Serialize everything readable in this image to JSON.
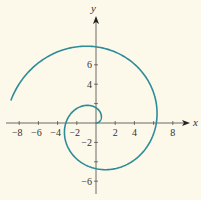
{
  "chart_data": {
    "type": "line",
    "title": "",
    "xlabel": "x",
    "ylabel": "y",
    "xlim": [
      -9.3,
      10
    ],
    "ylim": [
      -7.2,
      10
    ],
    "x_ticks": [
      -8,
      -6,
      -4,
      -2,
      2,
      4,
      8
    ],
    "x_tick_labels": [
      "−8",
      "−6",
      "−4",
      "−2",
      "2",
      "4",
      "8"
    ],
    "x_minor_ticks": [
      6
    ],
    "y_ticks": [
      6,
      4,
      -2,
      -6
    ],
    "y_tick_labels": [
      "6",
      "4",
      "−2",
      "−6"
    ],
    "y_minor_ticks": [
      2,
      -4
    ],
    "grid": false,
    "legend": null,
    "series": [
      {
        "name": "spiral",
        "equation": "r = theta",
        "theta_range": [
          0,
          9.17
        ],
        "color": "#2e8c98",
        "key_points": [
          {
            "x": 0,
            "y": 0
          },
          {
            "x": 0,
            "y": 1.57
          },
          {
            "x": -3.14,
            "y": 0
          },
          {
            "x": 0,
            "y": -4.71
          },
          {
            "x": 6.28,
            "y": 0
          },
          {
            "x": 0,
            "y": 7.85
          },
          {
            "x": -8.9,
            "y": 2.2
          }
        ]
      }
    ]
  },
  "style": {
    "background": "#fcf8ea",
    "axis_color": "#444444",
    "curve_color": "#2e8c98"
  }
}
